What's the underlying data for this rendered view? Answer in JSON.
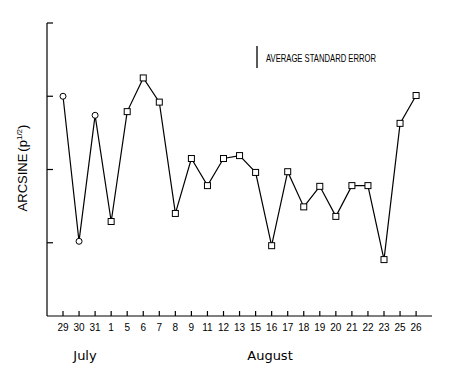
{
  "chart_data": {
    "type": "line",
    "title": "",
    "xlabel": "",
    "ylabel": "ARCSINE (p^1/2)",
    "ylabel_main": "ARCSINE",
    "ylabel_paren": "(p",
    "ylabel_sup": "1/2",
    "ylabel_close": ")",
    "legend": "AVERAGE STANDARD ERROR",
    "month_labels": [
      {
        "label": "July",
        "x": 85
      },
      {
        "label": "August",
        "x": 270
      }
    ],
    "categories": [
      "29",
      "30",
      "31",
      "1",
      "5",
      "6",
      "7",
      "8",
      "9",
      "11",
      "12",
      "13",
      "15",
      "16",
      "17",
      "18",
      "19",
      "20",
      "21",
      "22",
      "23",
      "25",
      "26"
    ],
    "values": [
      3.0,
      1.02,
      2.74,
      1.29,
      2.79,
      3.25,
      2.92,
      1.4,
      2.15,
      1.78,
      2.15,
      2.19,
      1.96,
      0.96,
      1.97,
      1.49,
      1.77,
      1.36,
      1.78,
      1.78,
      0.77,
      2.63,
      3.01
    ],
    "markers": [
      "circle",
      "circle",
      "circle",
      "square",
      "square",
      "square",
      "square",
      "square",
      "square",
      "square",
      "square",
      "square",
      "square",
      "square",
      "square",
      "square",
      "square",
      "square",
      "square",
      "square",
      "square",
      "square",
      "square"
    ],
    "ylim": [
      0,
      4
    ],
    "yticks": [
      0,
      1,
      2,
      3,
      4
    ],
    "grid": false,
    "legend_position": "top-right"
  }
}
